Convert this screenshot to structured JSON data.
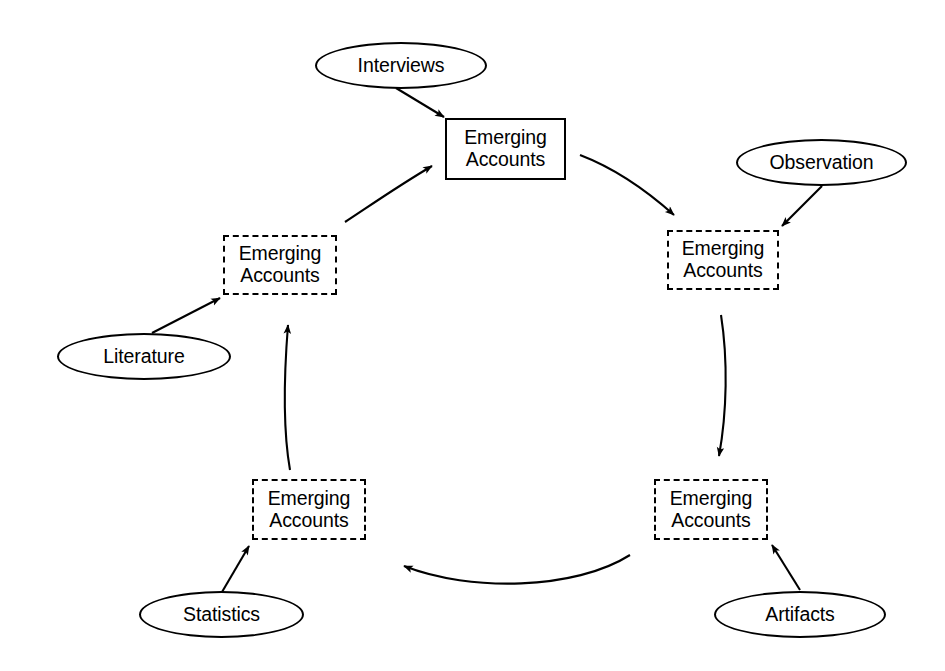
{
  "diagram": {
    "node_label_line1": "Emerging",
    "node_label_line2": "Accounts",
    "stroke_color": "#000000",
    "background_color": "#ffffff",
    "cycle_nodes": [
      {
        "id": "node-top",
        "label_line1": "Emerging",
        "label_line2": "Accounts",
        "border_style": "solid",
        "x": 445,
        "y": 118,
        "w": 121,
        "h": 62
      },
      {
        "id": "node-right",
        "label_line1": "Emerging",
        "label_line2": "Accounts",
        "border_style": "dashed",
        "x": 667,
        "y": 230,
        "w": 112,
        "h": 60
      },
      {
        "id": "node-bottom-right",
        "label_line1": "Emerging",
        "label_line2": "Accounts",
        "border_style": "dashed",
        "x": 654,
        "y": 479,
        "w": 114,
        "h": 61
      },
      {
        "id": "node-bottom-left",
        "label_line1": "Emerging",
        "label_line2": "Accounts",
        "border_style": "dashed",
        "x": 252,
        "y": 479,
        "w": 114,
        "h": 61
      },
      {
        "id": "node-left",
        "label_line1": "Emerging",
        "label_line2": "Accounts",
        "border_style": "dashed",
        "x": 223,
        "y": 235,
        "w": 114,
        "h": 60
      }
    ],
    "source_nodes": [
      {
        "id": "ellipse-interviews",
        "label": "Interviews",
        "x": 315,
        "y": 42,
        "w": 172,
        "h": 47
      },
      {
        "id": "ellipse-observation",
        "label": "Observation",
        "x": 736,
        "y": 139,
        "w": 171,
        "h": 47
      },
      {
        "id": "ellipse-artifacts",
        "label": "Artifacts",
        "x": 714,
        "y": 591,
        "w": 172,
        "h": 47
      },
      {
        "id": "ellipse-statistics",
        "label": "Statistics",
        "x": 139,
        "y": 591,
        "w": 165,
        "h": 47
      },
      {
        "id": "ellipse-literature",
        "label": "Literature",
        "x": 57,
        "y": 333,
        "w": 174,
        "h": 47
      }
    ],
    "cycle_edges": [
      {
        "id": "edge-left-to-top",
        "from": "node-left",
        "to": "node-top",
        "kind": "curved"
      },
      {
        "id": "edge-top-to-right",
        "from": "node-top",
        "to": "node-right",
        "kind": "curved"
      },
      {
        "id": "edge-right-to-bottom-right",
        "from": "node-right",
        "to": "node-bottom-right",
        "kind": "curved"
      },
      {
        "id": "edge-bottom-right-to-bottom-left",
        "from": "node-bottom-right",
        "to": "node-bottom-left",
        "kind": "curved"
      },
      {
        "id": "edge-bottom-left-to-left",
        "from": "node-bottom-left",
        "to": "node-left",
        "kind": "curved"
      }
    ],
    "source_edges": [
      {
        "id": "edge-interviews-to-top",
        "from": "ellipse-interviews",
        "to": "node-top",
        "kind": "straight"
      },
      {
        "id": "edge-observation-to-right",
        "from": "ellipse-observation",
        "to": "node-right",
        "kind": "straight"
      },
      {
        "id": "edge-artifacts-to-bottom-right",
        "from": "ellipse-artifacts",
        "to": "node-bottom-right",
        "kind": "straight"
      },
      {
        "id": "edge-statistics-to-bottom-left",
        "from": "ellipse-statistics",
        "to": "node-bottom-left",
        "kind": "straight"
      },
      {
        "id": "edge-literature-to-left",
        "from": "ellipse-literature",
        "to": "node-left",
        "kind": "straight"
      }
    ]
  }
}
